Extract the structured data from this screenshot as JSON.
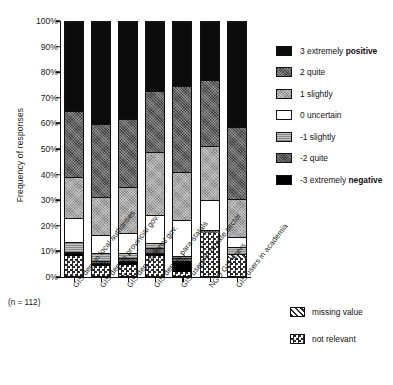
{
  "axis": {
    "ylabel": "Frequency of responses",
    "yticks": [
      "100%",
      "90%",
      "80%",
      "70%",
      "60%",
      "50%",
      "40%",
      "30%",
      "20%",
      "10%",
      "0%"
    ],
    "sample_note": "(n = 112)"
  },
  "legend": {
    "items": [
      {
        "key": "pos3",
        "label": "3 extremely ",
        "emphasis": "positive",
        "swatch": "f-pos3"
      },
      {
        "key": "quite2",
        "label": "2 quite",
        "emphasis": "",
        "swatch": "f-quite2"
      },
      {
        "key": "sl1",
        "label": "1 slightly",
        "emphasis": "",
        "swatch": "f-sl1"
      },
      {
        "key": "unc0",
        "label": "0 uncertain",
        "emphasis": "",
        "swatch": "f-unc0"
      },
      {
        "key": "slm1",
        "label": "-1 slightly",
        "emphasis": "",
        "swatch": "f-slm1"
      },
      {
        "key": "quitem2",
        "label": "-2 quite",
        "emphasis": "",
        "swatch": "f-quitem2"
      },
      {
        "key": "neg3",
        "label": "-3 extremely ",
        "emphasis": "negative",
        "swatch": "f-neg3"
      }
    ],
    "extra": [
      {
        "key": "missing",
        "label": "missing value",
        "swatch": "f-missing"
      },
      {
        "key": "notrel",
        "label": "not relevant",
        "swatch": "f-notrel"
      }
    ]
  },
  "chart_data": {
    "type": "bar",
    "title": "",
    "xlabel": "",
    "ylabel": "Frequency of responses",
    "ylim": [
      0,
      100
    ],
    "grid": false,
    "stacked": true,
    "stack_order_bottom_to_top": [
      "notrel",
      "missing",
      "neg3",
      "quitem2",
      "slm1",
      "unc0",
      "sl1",
      "quite2",
      "pos3"
    ],
    "legend_position": "right",
    "categories": [
      "GIS dep. in local authorities",
      "GIS dep. in provincial gov.",
      "GIS dep. national gov.",
      "GIS dep. in para-statals",
      "GIS users in private sector",
      "NGO GIS users",
      "GIS users in academia"
    ],
    "series": [
      {
        "name": "not relevant",
        "key": "notrel",
        "values": [
          8.0,
          4.0,
          4.5,
          8.0,
          1.5,
          17.0,
          7.0
        ]
      },
      {
        "name": "missing value",
        "key": "missing",
        "values": [
          0.0,
          0.0,
          0.0,
          0.0,
          0.0,
          0.0,
          1.5
        ]
      },
      {
        "name": "-3 extremely negative",
        "key": "neg3",
        "values": [
          1.0,
          1.0,
          1.5,
          1.0,
          4.5,
          0.0,
          0.0
        ]
      },
      {
        "name": "-2 quite",
        "key": "quitem2",
        "values": [
          0.5,
          1.0,
          1.0,
          2.0,
          1.0,
          1.0,
          0.0
        ]
      },
      {
        "name": "-1 slightly",
        "key": "slm1",
        "values": [
          4.0,
          3.0,
          2.0,
          2.0,
          1.0,
          0.0,
          3.0
        ]
      },
      {
        "name": "0 uncertain",
        "key": "unc0",
        "values": [
          9.5,
          7.0,
          8.0,
          11.0,
          14.0,
          12.0,
          4.0
        ]
      },
      {
        "name": "1 slightly",
        "key": "sl1",
        "values": [
          16.0,
          15.0,
          18.0,
          25.0,
          19.0,
          21.0,
          15.0
        ]
      },
      {
        "name": "2 quite",
        "key": "quite2",
        "values": [
          26.0,
          29.0,
          27.0,
          24.0,
          34.0,
          26.0,
          28.0
        ]
      },
      {
        "name": "3 extremely positive",
        "key": "pos3",
        "values": [
          35.0,
          40.0,
          38.0,
          27.0,
          25.0,
          23.0,
          41.5
        ]
      }
    ],
    "n": 112
  }
}
